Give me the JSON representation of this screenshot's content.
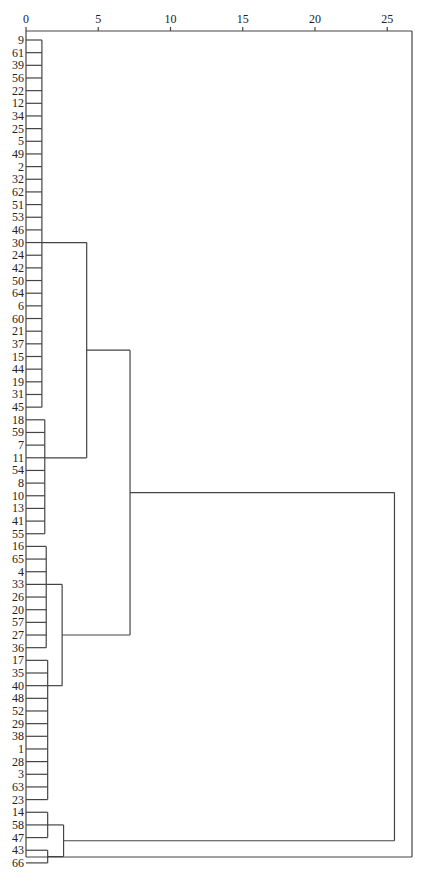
{
  "chart_data": {
    "type": "dendrogram",
    "title": "",
    "xlabel": "",
    "ylabel": "",
    "orientation": "horizontal",
    "x_ticks": [
      0,
      5,
      10,
      15,
      20,
      25
    ],
    "xlim": [
      0,
      26.5
    ],
    "grid": false,
    "legend": null,
    "leaves": [
      "9",
      "61",
      "39",
      "56",
      "22",
      "12",
      "34",
      "25",
      "5",
      "49",
      "2",
      "32",
      "62",
      "51",
      "53",
      "46",
      "30",
      "24",
      "42",
      "50",
      "64",
      "6",
      "60",
      "21",
      "37",
      "15",
      "44",
      "19",
      "31",
      "45",
      "18",
      "59",
      "7",
      "11",
      "54",
      "8",
      "10",
      "13",
      "41",
      "55",
      "16",
      "65",
      "4",
      "33",
      "26",
      "20",
      "57",
      "27",
      "36",
      "17",
      "35",
      "40",
      "48",
      "52",
      "29",
      "38",
      "1",
      "28",
      "3",
      "63",
      "23",
      "14",
      "58",
      "47",
      "43",
      "66"
    ],
    "clusters": [
      {
        "name": "A",
        "members": [
          "9",
          "61",
          "39",
          "56",
          "22",
          "12",
          "34",
          "25",
          "5",
          "49",
          "2",
          "32",
          "62",
          "51",
          "53",
          "46",
          "30",
          "24",
          "42",
          "50",
          "64",
          "6",
          "60",
          "21",
          "37",
          "15",
          "44",
          "19",
          "31",
          "45"
        ],
        "height": 1.1
      },
      {
        "name": "B",
        "members": [
          "18",
          "59",
          "7",
          "11",
          "54",
          "8",
          "10",
          "13",
          "41",
          "55"
        ],
        "height": 1.3
      },
      {
        "name": "C",
        "members": [
          "16",
          "65",
          "4",
          "33",
          "26",
          "20",
          "57",
          "27",
          "36"
        ],
        "height": 1.4
      },
      {
        "name": "D",
        "members": [
          "17",
          "35",
          "40",
          "48",
          "52",
          "29",
          "38",
          "1",
          "28",
          "3",
          "63",
          "23"
        ],
        "height": 1.5
      },
      {
        "name": "E1",
        "members": [
          "14",
          "58",
          "47"
        ],
        "height": 1.5
      },
      {
        "name": "E2",
        "members": [
          "43",
          "66"
        ],
        "height": 1.5
      }
    ],
    "merges": [
      {
        "left": "A",
        "right": "B",
        "height": 4.2
      },
      {
        "left": "C",
        "right": "D",
        "height": 2.5
      },
      {
        "left": "E1",
        "right": "E2",
        "height": 2.6
      },
      {
        "left": "A+B",
        "right": "C+D",
        "height": 7.2
      },
      {
        "left": "A+B+C+D",
        "right": "E1+E2",
        "height": 25.5
      }
    ]
  }
}
